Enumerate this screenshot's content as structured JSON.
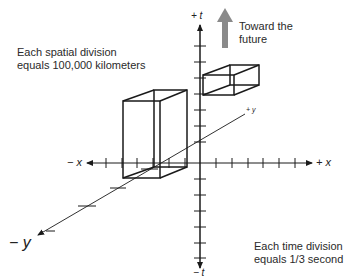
{
  "diagram": {
    "notes": {
      "spatial": [
        "Each spatial division",
        "equals 100,000 kilometers"
      ],
      "time": [
        "Each time division",
        "equals 1/3 second"
      ],
      "future": [
        "Toward the",
        "future"
      ]
    },
    "axes": {
      "plus_t": "+ t",
      "minus_t": "− t",
      "plus_x": "+ x",
      "minus_x": "− x",
      "plus_y": "+ y",
      "minus_y": "− y"
    },
    "colors": {
      "line": "#1a1a1a",
      "arrow": "#8a8a8a",
      "text": "#2a2a2a"
    }
  }
}
